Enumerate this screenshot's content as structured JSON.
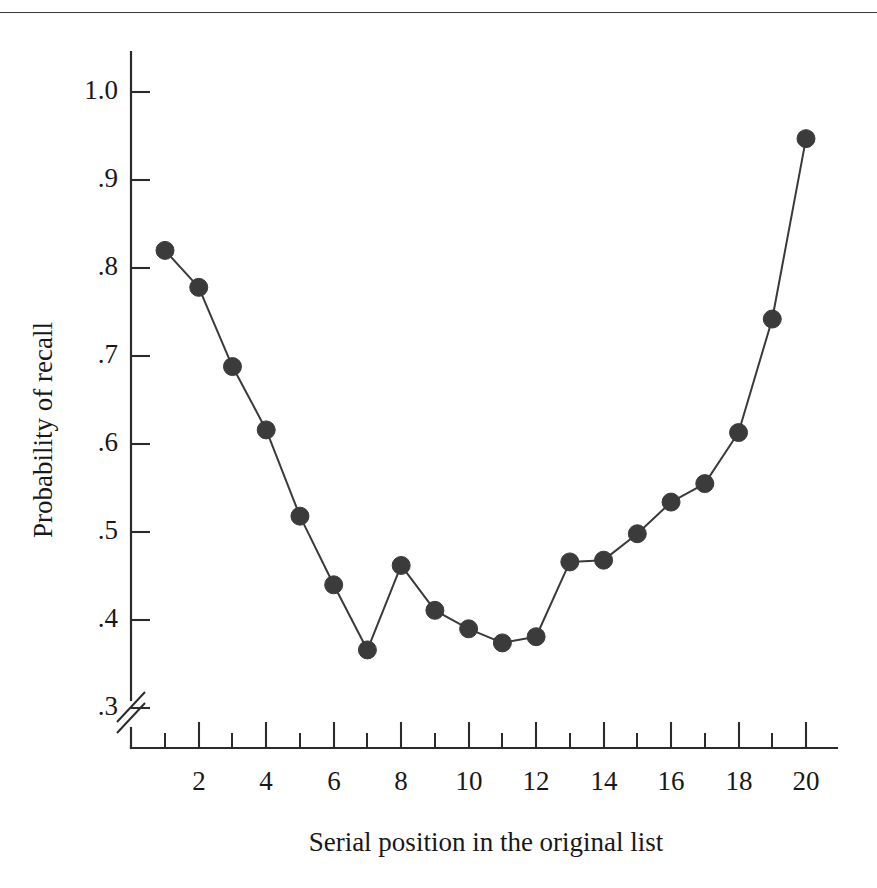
{
  "figure": {
    "has_top_rule": true,
    "background_color": "#ffffff",
    "ink_color": "#2b2b2b"
  },
  "chart_data": {
    "type": "line",
    "title": "",
    "xlabel": "Serial position in the original list",
    "ylabel": "Probability of recall",
    "x": [
      1,
      2,
      3,
      4,
      5,
      6,
      7,
      8,
      9,
      10,
      11,
      12,
      13,
      14,
      15,
      16,
      17,
      18,
      19,
      20
    ],
    "values": [
      0.82,
      0.778,
      0.688,
      0.616,
      0.518,
      0.44,
      0.366,
      0.462,
      0.411,
      0.39,
      0.374,
      0.381,
      0.466,
      0.468,
      0.498,
      0.534,
      0.555,
      0.613,
      0.742,
      0.947
    ],
    "series": [
      {
        "name": "Probability of recall",
        "marker": "filled-circle",
        "marker_color": "#3b3b3b",
        "line_color": "#3a3a3a",
        "values": [
          0.82,
          0.778,
          0.688,
          0.616,
          0.518,
          0.44,
          0.366,
          0.462,
          0.411,
          0.39,
          0.374,
          0.381,
          0.466,
          0.468,
          0.498,
          0.534,
          0.555,
          0.613,
          0.742,
          0.947
        ]
      }
    ],
    "xlim": [
      0.4,
      20.6
    ],
    "ylim": [
      0.28,
      1.04
    ],
    "y_axis_break": true,
    "y_axis_break_note": "axis break below .3",
    "yticks": [
      0.3,
      0.4,
      0.5,
      0.6,
      0.7,
      0.8,
      0.9,
      1.0
    ],
    "ytick_labels": [
      ".3",
      ".4",
      ".5",
      ".6",
      ".7",
      ".8",
      ".9",
      "1.0"
    ],
    "xticks_major": [
      2,
      4,
      6,
      8,
      10,
      12,
      14,
      16,
      18,
      20
    ],
    "xtick_labels": [
      "2",
      "4",
      "6",
      "8",
      "10",
      "12",
      "14",
      "16",
      "18",
      "20"
    ],
    "xticks_minor": [
      1,
      3,
      5,
      7,
      9,
      11,
      13,
      15,
      17,
      19
    ],
    "grid": false,
    "legend": "none"
  }
}
